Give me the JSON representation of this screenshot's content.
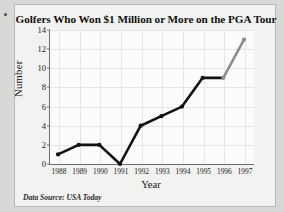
{
  "chart_data": {
    "type": "line",
    "title": "Golfers Who Won $1 Million or More on the PGA Tour",
    "xlabel": "Year",
    "ylabel": "Number",
    "categories": [
      "1988",
      "1989",
      "1990",
      "1991",
      "1992",
      "1993",
      "1994",
      "1995",
      "1996",
      "1997"
    ],
    "values": [
      1,
      2,
      2,
      0,
      4,
      5,
      6,
      9,
      9,
      13
    ],
    "series": [
      {
        "name": "Golfers winning $1 million or more",
        "values": [
          1,
          2,
          2,
          0,
          4,
          5,
          6,
          9,
          9,
          13
        ]
      }
    ],
    "ylim": [
      0,
      14
    ],
    "yticks": [
      0,
      2,
      4,
      6,
      8,
      10,
      12,
      14
    ],
    "ytick_labels": [
      "0",
      "2",
      "4",
      "6",
      "8",
      "10",
      "12",
      "14"
    ],
    "grid": true,
    "legend": "none",
    "line_color": "#111111",
    "highlight_segment_color": "#8d8d8d",
    "highlight_segment": [
      "1996",
      "1997"
    ],
    "marker": "circle",
    "annotations": [
      "Data Source:  USA Today"
    ]
  },
  "figure": {
    "title": "Golfers Who Won $1 Million or More on the PGA Tour",
    "source_note": "Data Source:  USA Today",
    "background_color": "#f2f2f0",
    "page_background_color": "#d8d8d6",
    "axis_color": "#6f6f6f"
  }
}
